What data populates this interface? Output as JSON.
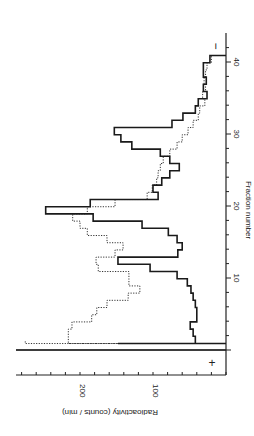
{
  "chart_data": {
    "type": "line",
    "subtype": "step",
    "rotation": "figure rotated 90 degrees clockwise (fraction axis vertical on right, radioactivity axis horizontal at bottom, increasing leftward)",
    "title": "",
    "xlabel": "Fraction number",
    "ylabel": "Radioactivity (counts / min)",
    "x_ticks": [
      10,
      20,
      30,
      40
    ],
    "y_ticks": [
      100,
      200
    ],
    "y_minor_tick_step": 20,
    "xlim": [
      0,
      42
    ],
    "ylim": [
      0,
      280
    ],
    "grid": false,
    "annotations": [
      {
        "text": "+",
        "position": "anode end, near fraction 0"
      },
      {
        "text": "−",
        "position": "cathode end, near fraction 41"
      }
    ],
    "x": [
      1,
      2,
      3,
      4,
      5,
      6,
      7,
      8,
      9,
      10,
      11,
      12,
      13,
      14,
      15,
      16,
      17,
      18,
      19,
      20,
      21,
      22,
      23,
      24,
      25,
      26,
      27,
      28,
      29,
      30,
      31,
      32,
      33,
      34,
      35,
      36,
      37,
      38,
      39,
      40
    ],
    "series": [
      {
        "name": "solid",
        "style": "solid",
        "values": [
          42,
          45,
          49,
          40,
          40,
          42,
          45,
          48,
          53,
          67,
          104,
          148,
          66,
          60,
          67,
          79,
          115,
          182,
          247,
          186,
          93,
          100,
          88,
          77,
          64,
          77,
          90,
          129,
          144,
          153,
          74,
          59,
          42,
          38,
          26,
          31,
          27,
          31,
          31,
          22
        ]
      },
      {
        "name": "dotted",
        "style": "dotted",
        "values": [
          216,
          216,
          211,
          184,
          177,
          163,
          134,
          118,
          133,
          133,
          175,
          178,
          152,
          141,
          163,
          190,
          200,
          210,
          190,
          152,
          108,
          101,
          95,
          93,
          90,
          86,
          77,
          67,
          60,
          52,
          45,
          38,
          36,
          29,
          32,
          28,
          30,
          28,
          26,
          20
        ]
      }
    ],
    "start_spikes": {
      "solid_fraction_0_to_1": 148,
      "dotted_start": 275
    }
  },
  "labels": {
    "xlabel": "Fraction number",
    "ylabel": "Radioactivity (counts / min)",
    "xtick_10": "10",
    "xtick_20": "20",
    "xtick_30": "30",
    "xtick_40": "40",
    "ytick_100": "100",
    "ytick_200": "200",
    "plus": "+",
    "minus": "−"
  }
}
